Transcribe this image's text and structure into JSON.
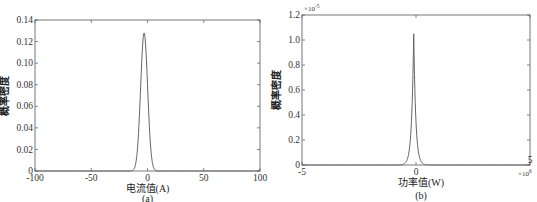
{
  "chart_data": [
    {
      "type": "line",
      "id": "a",
      "caption": "(a)",
      "title": "",
      "xlabel": "电流值(A)",
      "ylabel": "概率密度",
      "xlim": [
        -100,
        100
      ],
      "ylim": [
        0,
        0.14
      ],
      "xticks": [
        -100,
        -50,
        0,
        50,
        100
      ],
      "xtick_labels": [
        "-100",
        "-50",
        "0",
        "50",
        "100"
      ],
      "yticks": [
        0,
        0.02,
        0.04,
        0.06,
        0.08,
        0.1,
        0.12,
        0.14
      ],
      "ytick_labels": [
        "0",
        "0.02",
        "0.04",
        "0.06",
        "0.08",
        "0.10",
        "0.12",
        "0.14"
      ],
      "grid": false,
      "series": [
        {
          "name": "pdf",
          "shape": "gaussian",
          "mean": -3,
          "peak": 0.128,
          "std": 3.1
        }
      ],
      "line_color": "#666666"
    },
    {
      "type": "line",
      "id": "b",
      "caption": "(b)",
      "title": "",
      "xlabel": "功率值(W)",
      "ylabel": "概率密度",
      "xlim": [
        -5,
        5
      ],
      "x_multiplier": "×10",
      "x_multiplier_exp": "6",
      "ylim": [
        0,
        1.2
      ],
      "y_multiplier": "×10",
      "y_multiplier_exp": "-5",
      "xticks": [
        -5,
        0,
        5
      ],
      "xtick_labels": [
        "-5",
        "0",
        "5"
      ],
      "yticks": [
        0,
        0.2,
        0.4,
        0.6,
        0.8,
        1.0,
        1.2
      ],
      "ytick_labels": [
        "0",
        "0.2",
        "0.4",
        "0.6",
        "0.8",
        "1.0",
        "1.2"
      ],
      "grid": false,
      "series": [
        {
          "name": "pdf",
          "shape": "laplace",
          "mean": -0.1,
          "peak": 1.05,
          "scale": 0.09
        }
      ],
      "line_color": "#666666"
    }
  ]
}
